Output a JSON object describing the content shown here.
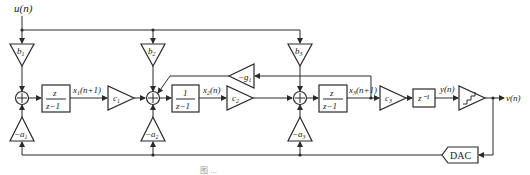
{
  "diagram": {
    "type": "block-diagram",
    "input_label": "u(n)",
    "output_label": "v(n)",
    "quantizer_input_label": "y(n)",
    "feedforward_gains": [
      "b1",
      "b2",
      "b3"
    ],
    "feedback_gains": [
      "-a1",
      "-a2",
      "-a3"
    ],
    "resonator_gain": "-g1",
    "interstage_gains": [
      "c1",
      "c2",
      "c3"
    ],
    "state_labels": [
      "x1(n+1)",
      "x2(n)",
      "x3(n+1)"
    ],
    "integrators": [
      {
        "num": "z",
        "den": "z−1"
      },
      {
        "num": "1",
        "den": "z−1"
      },
      {
        "num": "z",
        "den": "z−1"
      }
    ],
    "delay": "z⁻¹",
    "dac_label": "DAC",
    "caption": "图 ..."
  }
}
